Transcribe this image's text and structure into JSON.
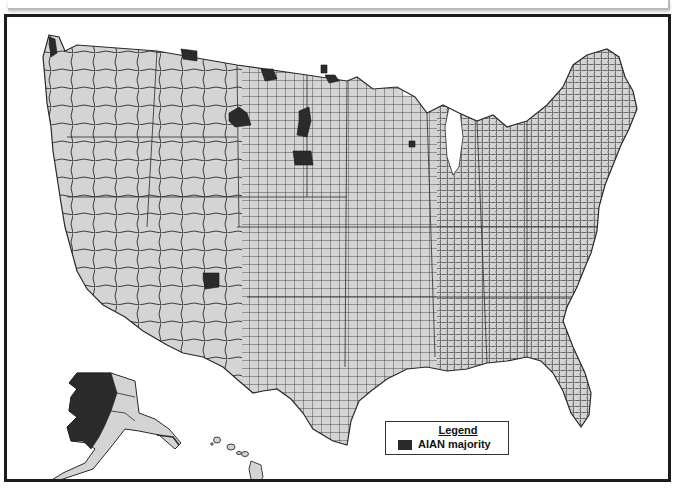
{
  "map": {
    "subject": "Counties with American Indian and Alaska Native (AIAN) majority",
    "region": "United States (counties), incl. Alaska and Hawaii insets",
    "colors": {
      "county_fill": "#d4d4d4",
      "county_border": "#2a2a2a",
      "majority_fill": "#2b2b2b",
      "background": "#ffffff",
      "frame": "#1c1c1c"
    },
    "highlighted_areas": [
      "Northwest Washington (coastal)",
      "Northern Montana (Glacier)",
      "North Dakota (Rolette / Sioux area)",
      "North Dakota central-north",
      "Central Montana (Big Horn / Rosebud area)",
      "South Dakota west-central (Dewey, Ziebach, Corson)",
      "South Dakota southwest (Shannon, Todd)",
      "Northwest New Mexico / Arizona border (Apache, McKinley)",
      "Wisconsin (Menominee)",
      "Western & northern Alaska (large area)"
    ]
  },
  "legend": {
    "title": "Legend",
    "items": [
      {
        "label": "AIAN majority",
        "color": "#2b2b2b"
      }
    ]
  }
}
